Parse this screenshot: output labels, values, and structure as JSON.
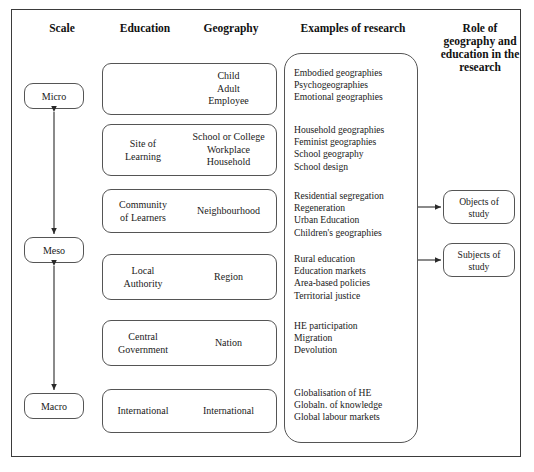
{
  "figure": {
    "headers": {
      "scale": "Scale",
      "education": "Education",
      "geography": "Geography",
      "examples": "Examples of research",
      "role": "Role of geography and education in the research"
    },
    "scale_levels": [
      {
        "id": "micro",
        "label": "Micro"
      },
      {
        "id": "meso",
        "label": "Meso"
      },
      {
        "id": "macro",
        "label": "Macro"
      }
    ],
    "rows": [
      {
        "education": "Learner",
        "geography": "Child\nAdult\nEmployee",
        "geography_lines": [
          "Child",
          "Adult",
          "Employee"
        ],
        "research": [
          "Embodied geographies",
          "Psychogeographies",
          "Emotional geographies"
        ]
      },
      {
        "education": "Site of\nLearning",
        "education_lines": [
          "Site of",
          "Learning"
        ],
        "geography": "School or College\nWorkplace\nHousehold",
        "geography_lines": [
          "School or College",
          "Workplace",
          "Household"
        ],
        "research": [
          "Household geographies",
          "Feminist geographies",
          "School geography",
          "School design"
        ]
      },
      {
        "education": "Community\nof Learners",
        "education_lines": [
          "Community",
          "of Learners"
        ],
        "geography": "Neighbourhood",
        "geography_lines": [
          "Neighbourhood"
        ],
        "research": [
          "Residential segregation",
          "Regeneration",
          "Urban Education",
          "Children's geographies"
        ]
      },
      {
        "education": "Local\nAuthority",
        "education_lines": [
          "Local",
          "Authority"
        ],
        "geography": "Region",
        "geography_lines": [
          "Region"
        ],
        "research": [
          "Rural education",
          "Education markets",
          "Area-based policies",
          "Territorial justice"
        ]
      },
      {
        "education": "Central\nGovernment",
        "education_lines": [
          "Central",
          "Government"
        ],
        "geography": "Nation",
        "geography_lines": [
          "Nation"
        ],
        "research": [
          "HE participation",
          "Migration",
          "Devolution"
        ]
      },
      {
        "education": "International",
        "education_lines": [
          "International"
        ],
        "geography": "International",
        "geography_lines": [
          "International"
        ],
        "research": [
          "Globalisation of HE",
          "Globaln. of knowledge",
          "Global labour markets"
        ]
      }
    ],
    "role_boxes": [
      {
        "id": "objects",
        "label": "Objects of study",
        "lines": [
          "Objects of",
          "study"
        ]
      },
      {
        "id": "subjects",
        "label": "Subjects of study",
        "lines": [
          "Subjects of",
          "study"
        ]
      }
    ],
    "colors": {
      "frame": "#3b3b3b",
      "box_stroke": "#555555",
      "text": "#1a1a1a",
      "background": "#ffffff"
    }
  }
}
